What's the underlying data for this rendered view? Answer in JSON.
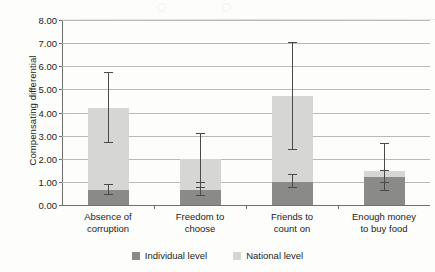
{
  "chart_data": {
    "type": "bar",
    "title": "",
    "subtitle": "",
    "xlabel": "",
    "ylabel": "Compensating differential",
    "ylim": [
      0,
      8
    ],
    "ytick_step": 1,
    "grid": true,
    "stacked": true,
    "legend_position": "bottom",
    "categories": [
      "Absence of corruption",
      "Freedom to choose",
      "Friends to count on",
      "Enough money to buy food"
    ],
    "category_lines": [
      [
        "Absence of",
        "corruption"
      ],
      [
        "Freedom to",
        "choose"
      ],
      [
        "Friends to",
        "count on"
      ],
      [
        "Enough money",
        "to buy food"
      ]
    ],
    "ytick_labels": [
      "8.00",
      "7.00",
      "6.00",
      "5.00",
      "4.00",
      "3.00",
      "2.00",
      "1.00",
      "0.00"
    ],
    "series": [
      {
        "name": "Individual level",
        "color": "#8a8a89",
        "values": [
          0.65,
          0.65,
          1.0,
          1.2
        ],
        "errors_low": [
          0.45,
          0.38,
          0.72,
          0.95
        ],
        "errors_high": [
          0.85,
          0.95,
          1.3,
          1.48
        ]
      },
      {
        "name": "National level",
        "color": "#d6d6d4",
        "values": [
          4.2,
          2.0,
          4.7,
          1.45
        ],
        "errors_low": [
          2.7,
          0.75,
          2.4,
          0.6
        ],
        "errors_high": [
          5.7,
          3.05,
          7.0,
          2.65
        ]
      }
    ],
    "totals": [
      4.2,
      2.0,
      4.7,
      1.45
    ],
    "axis_color": "#6f6f6f",
    "grid_color": "#b9b9b9",
    "error_bar_color": "#4a4a4a",
    "background_color": "#fdfdfc"
  },
  "legend": {
    "items": [
      {
        "label": "Individual level",
        "color": "#8a8a89"
      },
      {
        "label": "National level",
        "color": "#d6d6d4"
      }
    ]
  }
}
